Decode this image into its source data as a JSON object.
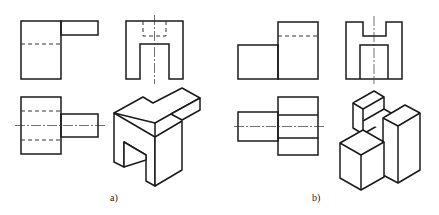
{
  "figure": {
    "panels": [
      {
        "id": "a",
        "label": "a)",
        "views": [
          "front-view",
          "side-view",
          "top-view",
          "isometric-view"
        ]
      },
      {
        "id": "b",
        "label": "b)",
        "views": [
          "front-view",
          "side-view",
          "top-view",
          "isometric-view"
        ]
      }
    ],
    "line_types": [
      "visible-outline",
      "hidden-line",
      "center-line"
    ],
    "colors": {
      "line": "#1a1a1a",
      "background": "#ffffff"
    }
  }
}
